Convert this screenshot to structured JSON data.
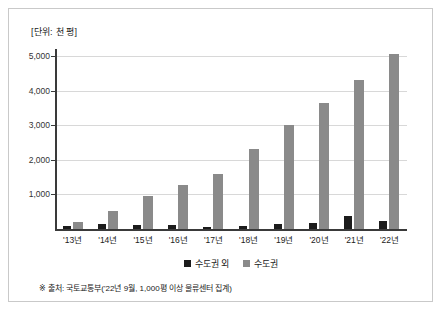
{
  "unit_label": "[단위: 천 평]",
  "note": "※ 출처: 국토교통부('22년 9월, 1,000평 이상 물류센터 집계)",
  "colors": {
    "capital_area": "#8a8a8a",
    "non_capital_area": "#1c1c1c",
    "gridline": "#d8d8d8",
    "axis": "#3a3a3a",
    "border": "#c9c9c9"
  },
  "legend": {
    "items": [
      {
        "label": "수도권 외",
        "color": "#1c1c1c"
      },
      {
        "label": "수도권",
        "color": "#8a8a8a"
      }
    ]
  },
  "chart_data": {
    "type": "bar",
    "title": "",
    "xlabel": "",
    "ylabel": "[단위: 천 평]",
    "ylim": [
      0,
      5200
    ],
    "yticks": [
      1000,
      2000,
      3000,
      4000,
      5000
    ],
    "ytick_labels": [
      "1,000",
      "2,000",
      "3,000",
      "4,000",
      "5,000"
    ],
    "grid": true,
    "legend_position": "bottom-center",
    "categories": [
      "'13년",
      "'14년",
      "'15년",
      "'16년",
      "'17년",
      "'18년",
      "'19년",
      "'20년",
      "'21년",
      "'22년"
    ],
    "series": [
      {
        "name": "수도권 외",
        "color": "#1c1c1c",
        "values": [
          80,
          150,
          110,
          130,
          60,
          100,
          140,
          170,
          390,
          220
        ]
      },
      {
        "name": "수도권",
        "color": "#8a8a8a",
        "values": [
          190,
          530,
          950,
          1260,
          1600,
          2300,
          3000,
          3650,
          4300,
          5060
        ]
      }
    ]
  }
}
